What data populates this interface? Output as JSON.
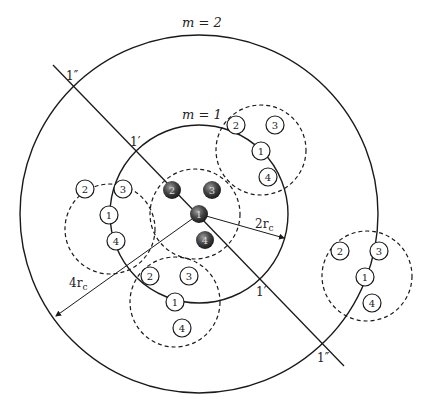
{
  "diagram": {
    "labels": {
      "outer_ring": "m = 2",
      "inner_ring": "m = 1",
      "radius_inner": "2r",
      "radius_inner_sub": "c",
      "radius_outer": "4r",
      "radius_outer_sub": "c",
      "cut_prime_top": "1′",
      "cut_prime_bottom": "1′",
      "cut_dprime_top": "1″",
      "cut_dprime_bottom": "1″"
    },
    "center_cluster": {
      "spheres": [
        {
          "id": "1",
          "label": "1"
        },
        {
          "id": "2",
          "label": "2"
        },
        {
          "id": "3",
          "label": "3"
        },
        {
          "id": "4",
          "label": "4"
        }
      ]
    },
    "clusters": [
      {
        "name": "upper-right",
        "nodes": [
          "2",
          "3",
          "1",
          "4"
        ]
      },
      {
        "name": "left",
        "nodes": [
          "2",
          "3",
          "1",
          "4"
        ]
      },
      {
        "name": "lower",
        "nodes": [
          "2",
          "3",
          "1",
          "4"
        ]
      },
      {
        "name": "far-right",
        "nodes": [
          "2",
          "3",
          "1",
          "4"
        ]
      }
    ],
    "colors": {
      "line": "#1a1a1a",
      "sphere_dark": "#2b2b2b",
      "sphere_light": "#8a8a8a",
      "background": "#ffffff"
    }
  }
}
